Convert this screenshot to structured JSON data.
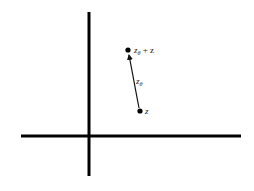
{
  "diagram": {
    "type": "complex-plane-vector-addition",
    "axes": {
      "horizontal": {
        "x1": 21,
        "x2": 241,
        "y": 136
      },
      "vertical": {
        "x": 89,
        "y1": 12,
        "y2": 176
      },
      "color": "#000000"
    },
    "points": [
      {
        "id": "z",
        "label_main": "z",
        "label_sub": "",
        "label_suffix": "",
        "x": 140,
        "y": 111
      },
      {
        "id": "z-theta-plus-z",
        "label_main": "z",
        "label_sub": "θ",
        "label_suffix": " + z",
        "x": 128,
        "y": 50
      }
    ],
    "arrow": {
      "from": "z",
      "to": "z-theta-plus-z",
      "label_main": "z",
      "label_sub": "θ"
    }
  }
}
